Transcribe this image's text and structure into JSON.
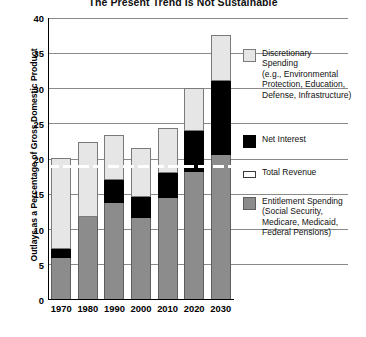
{
  "chart_data": {
    "type": "bar",
    "title": "The Present Trend Is Not Sustainable",
    "xlabel": "",
    "ylabel": "Outlays as a Percentage of Gross Domestic Product",
    "categories": [
      "1970",
      "1980",
      "1990",
      "2000",
      "2010",
      "2020",
      "2030"
    ],
    "ylim": [
      0,
      40
    ],
    "yticks": [
      0,
      5,
      10,
      15,
      20,
      25,
      30,
      35,
      40
    ],
    "grid": true,
    "stacked": true,
    "legend_position": "right",
    "series": [
      {
        "name": "Entitlement Spending",
        "color": "#8c8c8c",
        "values": [
          6.0,
          11.8,
          13.8,
          11.6,
          14.5,
          18.2,
          20.6
        ]
      },
      {
        "name": "Net Interest",
        "color": "#000000",
        "values": [
          1.3,
          0.0,
          3.2,
          3.0,
          3.5,
          5.8,
          10.4
        ]
      },
      {
        "name": "Discretionary Spending",
        "color": "#e6e6e6",
        "values": [
          12.7,
          10.5,
          6.2,
          6.8,
          6.3,
          6.0,
          6.5
        ]
      }
    ],
    "totals": [
      20.0,
      22.3,
      23.2,
      21.4,
      24.3,
      30.0,
      37.5
    ],
    "reference_line": {
      "name": "Total Revenue",
      "value": 19.0,
      "style": "white-dashed"
    }
  },
  "legend": {
    "items": [
      {
        "name": "discretionary",
        "swatch": "light-gray",
        "label": "Discretionary\nSpending\n(e.g., Environmental\nProtection, Education,\nDefense, Infrastructure)"
      },
      {
        "name": "net-interest",
        "swatch": "black",
        "label": "Net Interest"
      },
      {
        "name": "total-revenue",
        "swatch": "white-line",
        "label": "Total Revenue"
      },
      {
        "name": "entitlement",
        "swatch": "dark-gray",
        "label": "Entitlement Spending\n(Social Security,\nMedicare, Medicaid,\nFederal Pensions)"
      }
    ]
  }
}
